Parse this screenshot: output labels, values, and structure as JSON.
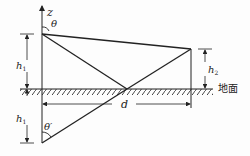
{
  "diagram": {
    "axis_label": "z",
    "angle_top": "θ",
    "angle_bottom": "θ′",
    "height_source": "h",
    "height_source_sub": "1",
    "height_image": "h",
    "height_image_sub": "1",
    "height_receiver": "h",
    "height_receiver_sub": "2",
    "distance": "d",
    "ground_label": "地面",
    "line_color": "#222222"
  }
}
